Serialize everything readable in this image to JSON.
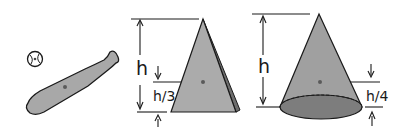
{
  "figure": {
    "colors": {
      "fill": "#a8a8a8",
      "dark_fill": "#7a7a7a",
      "stroke": "#1a1a1a",
      "dot": "#5a5a5a",
      "background": "#ffffff"
    }
  },
  "bat": {
    "label": ""
  },
  "triangle": {
    "height_label": "h",
    "offset_label": "h/3"
  },
  "cone": {
    "height_label": "h",
    "offset_label": "h/4"
  }
}
